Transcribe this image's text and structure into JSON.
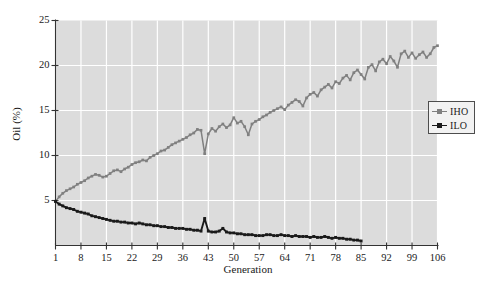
{
  "chart_data": {
    "type": "line",
    "title": "",
    "xlabel": "Generation",
    "ylabel": "Oil (%)",
    "xlim": [
      1,
      106
    ],
    "ylim": [
      0,
      25
    ],
    "xticks": [
      1,
      8,
      15,
      22,
      29,
      36,
      43,
      50,
      57,
      64,
      71,
      78,
      85,
      92,
      99,
      106
    ],
    "yticks": [
      5,
      10,
      15,
      20,
      25
    ],
    "grid": true,
    "legend_position": "right-middle",
    "plot_background": "#dcdcdc",
    "gridline_color": "#ffffff",
    "axis_color": "#333333",
    "series": [
      {
        "name": "IHO",
        "color": "#808080",
        "marker": "square",
        "x": [
          1,
          2,
          3,
          4,
          5,
          6,
          7,
          8,
          9,
          10,
          11,
          12,
          13,
          14,
          15,
          16,
          17,
          18,
          19,
          20,
          21,
          22,
          23,
          24,
          25,
          26,
          27,
          28,
          29,
          30,
          31,
          32,
          33,
          34,
          35,
          36,
          37,
          38,
          39,
          40,
          41,
          42,
          43,
          44,
          45,
          46,
          47,
          48,
          49,
          50,
          51,
          52,
          53,
          54,
          55,
          56,
          57,
          58,
          59,
          60,
          61,
          62,
          63,
          64,
          65,
          66,
          67,
          68,
          69,
          70,
          71,
          72,
          73,
          74,
          75,
          76,
          77,
          78,
          79,
          80,
          81,
          82,
          83,
          84,
          85,
          86,
          87,
          88,
          89,
          90,
          91,
          92,
          93,
          94,
          95,
          96,
          97,
          98,
          99,
          100,
          101,
          102,
          103,
          104,
          105,
          106
        ],
        "values": [
          4.9,
          5.4,
          5.8,
          6.1,
          6.3,
          6.5,
          6.8,
          7.0,
          7.2,
          7.5,
          7.7,
          7.9,
          7.8,
          7.6,
          7.7,
          8.0,
          8.3,
          8.4,
          8.2,
          8.5,
          8.7,
          9.0,
          9.2,
          9.3,
          9.5,
          9.4,
          9.8,
          10.0,
          10.2,
          10.5,
          10.6,
          10.9,
          11.2,
          11.4,
          11.6,
          11.8,
          12.0,
          12.3,
          12.5,
          12.9,
          12.8,
          10.2,
          12.4,
          13.0,
          12.7,
          13.2,
          13.5,
          13.1,
          13.4,
          14.2,
          13.6,
          13.8,
          13.2,
          12.3,
          13.5,
          13.8,
          14.0,
          14.3,
          14.5,
          14.8,
          15.0,
          15.2,
          15.4,
          15.1,
          15.6,
          15.9,
          16.2,
          16.0,
          15.5,
          16.4,
          16.8,
          17.0,
          16.6,
          17.3,
          17.6,
          17.9,
          17.5,
          18.2,
          18.0,
          18.6,
          18.9,
          18.4,
          19.2,
          19.5,
          19.0,
          18.5,
          19.8,
          20.1,
          19.4,
          20.4,
          20.7,
          20.2,
          21.0,
          20.5,
          19.8,
          21.3,
          21.6,
          20.9,
          21.4,
          20.8,
          21.2,
          21.5,
          20.9,
          21.3,
          22.0,
          22.2
        ]
      },
      {
        "name": "ILO",
        "color": "#1a1a1a",
        "marker": "square",
        "x": [
          1,
          2,
          3,
          4,
          5,
          6,
          7,
          8,
          9,
          10,
          11,
          12,
          13,
          14,
          15,
          16,
          17,
          18,
          19,
          20,
          21,
          22,
          23,
          24,
          25,
          26,
          27,
          28,
          29,
          30,
          31,
          32,
          33,
          34,
          35,
          36,
          37,
          38,
          39,
          40,
          41,
          42,
          43,
          44,
          45,
          46,
          47,
          48,
          49,
          50,
          51,
          52,
          53,
          54,
          55,
          56,
          57,
          58,
          59,
          60,
          61,
          62,
          63,
          64,
          65,
          66,
          67,
          68,
          69,
          70,
          71,
          72,
          73,
          74,
          75,
          76,
          77,
          78,
          79,
          80,
          81,
          82,
          83,
          84,
          85
        ],
        "values": [
          4.9,
          4.6,
          4.4,
          4.2,
          4.1,
          4.0,
          3.8,
          3.7,
          3.6,
          3.5,
          3.3,
          3.2,
          3.1,
          3.0,
          2.9,
          2.8,
          2.7,
          2.7,
          2.6,
          2.6,
          2.5,
          2.5,
          2.4,
          2.5,
          2.4,
          2.3,
          2.3,
          2.2,
          2.2,
          2.1,
          2.1,
          2.0,
          2.0,
          1.9,
          1.9,
          1.9,
          1.8,
          1.8,
          1.7,
          1.7,
          1.6,
          3.0,
          1.6,
          1.5,
          1.5,
          1.6,
          1.9,
          1.5,
          1.4,
          1.4,
          1.3,
          1.3,
          1.2,
          1.2,
          1.2,
          1.1,
          1.1,
          1.1,
          1.2,
          1.2,
          1.1,
          1.1,
          1.2,
          1.1,
          1.1,
          1.0,
          1.1,
          1.0,
          1.0,
          1.0,
          0.9,
          1.0,
          0.9,
          0.9,
          1.0,
          0.9,
          0.8,
          0.9,
          0.8,
          0.8,
          0.7,
          0.7,
          0.6,
          0.6,
          0.5
        ]
      }
    ]
  },
  "legend": {
    "entries": [
      {
        "label": "IHO"
      },
      {
        "label": "ILO"
      }
    ]
  }
}
